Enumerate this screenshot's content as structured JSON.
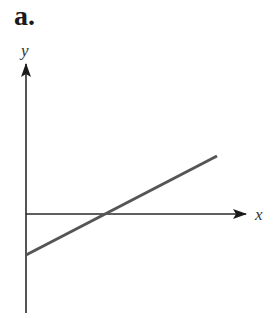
{
  "panel": {
    "label": "a."
  },
  "axes": {
    "x_label": "x",
    "y_label": "y",
    "color": "#2a2a2a"
  },
  "line": {
    "color": "#555555",
    "description": "straight line with positive slope, negative y-intercept, crossing the x-axis to the right of the origin"
  }
}
